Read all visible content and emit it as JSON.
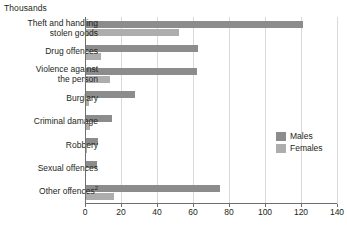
{
  "chart_data": {
    "type": "bar",
    "orientation": "horizontal",
    "title": "Thousands",
    "xlabel": "",
    "ylabel": "",
    "xlim": [
      0,
      140
    ],
    "xticks": [
      0,
      20,
      40,
      60,
      80,
      100,
      120,
      140
    ],
    "grid": true,
    "legend_position": "right",
    "categories": [
      "Theft and handling\nstolen goods",
      "Drug offences",
      "Violence against\nthe person",
      "Burglary",
      "Criminal damage",
      "Robbery",
      "Sexual offences",
      "Other offences"
    ],
    "category_footnotes": [
      "",
      "",
      "",
      "",
      "",
      "",
      "",
      "2"
    ],
    "series": [
      {
        "name": "Males",
        "color": "#8c8c8c",
        "values": [
          121,
          63,
          62,
          28,
          15,
          7,
          6.5,
          75
        ]
      },
      {
        "name": "Females",
        "color": "#adadad",
        "values": [
          52,
          9,
          14,
          2,
          3,
          1,
          0.5,
          16
        ]
      }
    ]
  },
  "legend": {
    "items": [
      {
        "label": "Males"
      },
      {
        "label": "Females"
      }
    ]
  }
}
